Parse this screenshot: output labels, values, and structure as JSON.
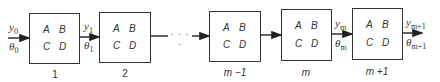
{
  "diagram": {
    "type": "cascade of two-port blocks",
    "matrix_entries": [
      "A",
      "B",
      "C",
      "D"
    ],
    "blocks": [
      {
        "label": "1"
      },
      {
        "label": "2"
      },
      {
        "label": "m −1"
      },
      {
        "label": "m"
      },
      {
        "label": "m +1"
      }
    ],
    "ellipsis": "· · · ·",
    "signals": [
      {
        "top": "y",
        "top_sub": "0",
        "bottom": "θ",
        "bottom_sub": "0"
      },
      {
        "top": "y",
        "top_sub": "1",
        "bottom": "θ",
        "bottom_sub": "1"
      },
      {
        "top": "y",
        "top_sub": "m",
        "bottom": "θ",
        "bottom_sub": "m"
      },
      {
        "top": "y",
        "top_sub": "m+1",
        "bottom": "θ",
        "bottom_sub": "m+1"
      }
    ]
  }
}
